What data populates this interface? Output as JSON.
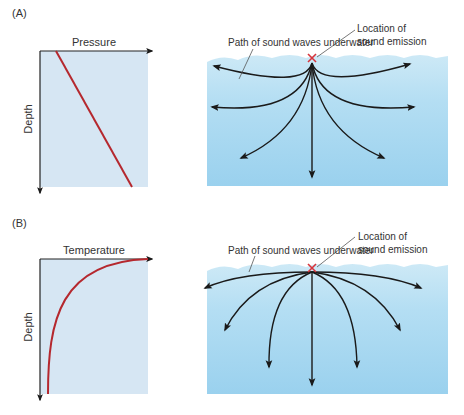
{
  "panels": [
    {
      "label": "(A)",
      "chart": {
        "x_axis_label": "Pressure",
        "y_axis_label": "Depth",
        "curve": "linear"
      },
      "diagram": {
        "path_label": "Path of sound waves underwater",
        "emission_label_line1": "Location of",
        "emission_label_line2": "sound emission",
        "marker": "×"
      }
    },
    {
      "label": "(B)",
      "chart": {
        "x_axis_label": "Temperature",
        "y_axis_label": "Depth",
        "curve": "exponential-decay"
      },
      "diagram": {
        "path_label": "Path of sound waves underwater",
        "emission_label_line1": "Location of",
        "emission_label_line2": "sound emission",
        "marker": "×"
      }
    }
  ],
  "colors": {
    "chart_bg": "#d6e6f3",
    "water_top": "#c9e6f4",
    "water_bottom": "#9ed3ef",
    "curve": "#b5282e",
    "marker": "#d8343b",
    "axis": "#222222",
    "ray": "#1a1a1a"
  }
}
